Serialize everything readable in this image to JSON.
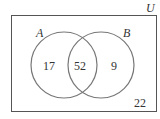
{
  "diagram": {
    "type": "venn",
    "universe_label": "U",
    "sets": [
      {
        "name": "A",
        "only": "17"
      },
      {
        "name": "B",
        "only": "9"
      }
    ],
    "intersection": "52",
    "outside": "22"
  }
}
